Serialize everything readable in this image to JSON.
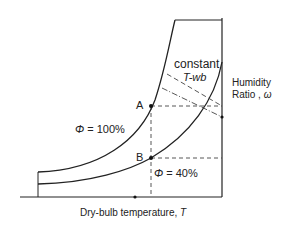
{
  "diagram": {
    "type": "psychrometric-chart-schematic",
    "colors": {
      "line": "#222222",
      "background": "#ffffff"
    },
    "labels": {
      "constant_line1": "constant",
      "constant_line2": "T-wb",
      "humidity_line1": "Humidity",
      "humidity_line2_text": "Ratio , ",
      "humidity_symbol": "ω",
      "point_a": "A",
      "point_b": "B",
      "phi_symbol": "Φ",
      "phi_100_text": " = 100%",
      "phi_40_text": " = 40%",
      "x_axis_text": "Dry-bulb temperature, ",
      "x_axis_symbol": "T"
    },
    "curves": [
      {
        "name": "saturation",
        "relative_humidity": "100%"
      },
      {
        "name": "relative-humidity-40",
        "relative_humidity": "40%"
      }
    ],
    "points": [
      {
        "name": "A",
        "on_curve": "Φ = 100%"
      },
      {
        "name": "B",
        "on_curve": "Φ = 40%"
      }
    ]
  }
}
